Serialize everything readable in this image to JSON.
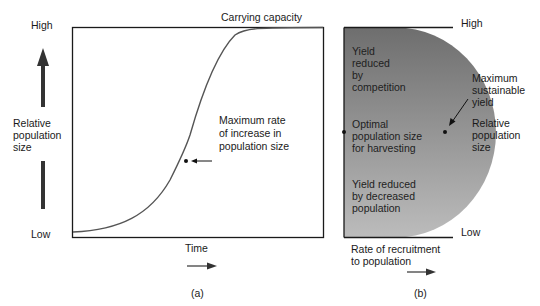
{
  "panel_a": {
    "y_high": "High",
    "y_low": "Low",
    "y_label": "Relative\npopulation\nsize",
    "x_label": "Time",
    "top_label": "Carrying capacity",
    "annotation": "Maximum rate\nof increase in\npopulation size",
    "caption": "(a)"
  },
  "panel_b": {
    "y_high": "High",
    "y_low": "Low",
    "region_top": "Yield\nreduced\nby\ncompetition",
    "region_mid": "Optimal\npopulation size\nfor harvesting",
    "region_bottom": "Yield reduced\nby decreased\npopulation",
    "annotation": "Maximum\nsustainable\nyield",
    "right_label": "Relative\npopulation\nsize",
    "x_label": "Rate of recruitment\nto population",
    "caption": "(b)"
  },
  "colors": {
    "curve": "#555555",
    "axis": "#1a1a1a",
    "fill_dark": "#7a7a7a",
    "fill_light": "#b8b8b8"
  }
}
